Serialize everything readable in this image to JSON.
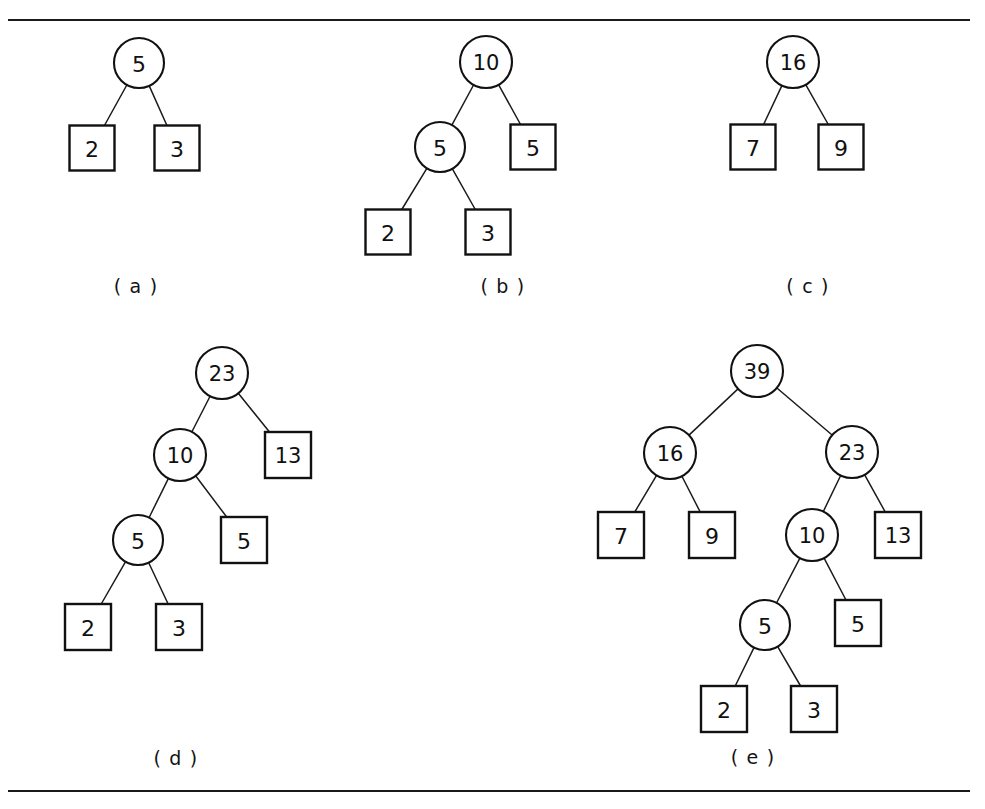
{
  "figure": {
    "background_color": "#ffffff",
    "ink_color": "#111111",
    "top_rule": {
      "x": 8,
      "y": 19,
      "width": 962,
      "label": "horizontal-rule-top"
    },
    "bottom_rule": {
      "x": 8,
      "y": 790,
      "width": 962,
      "label": "horizontal-rule-bottom"
    }
  },
  "panels": [
    {
      "id": "a",
      "label": "( a )",
      "label_x": 136,
      "label_y": 286,
      "nodes": [
        {
          "name": "node-circle-5",
          "shape": "circle",
          "value": "5",
          "cx": 139,
          "cy": 63,
          "r": 25
        },
        {
          "name": "node-square-2",
          "shape": "square",
          "value": "2",
          "cx": 92,
          "cy": 148,
          "size": 45
        },
        {
          "name": "node-square-3",
          "shape": "square",
          "value": "3",
          "cx": 177,
          "cy": 148,
          "size": 45
        }
      ],
      "edges": [
        {
          "from": "node-circle-5",
          "to": "node-square-2"
        },
        {
          "from": "node-circle-5",
          "to": "node-square-3"
        }
      ]
    },
    {
      "id": "b",
      "label": "( b )",
      "label_x": 503,
      "label_y": 286,
      "nodes": [
        {
          "name": "node-circle-10",
          "shape": "circle",
          "value": "10",
          "cx": 486,
          "cy": 62,
          "r": 26
        },
        {
          "name": "node-circle-5",
          "shape": "circle",
          "value": "5",
          "cx": 440,
          "cy": 147,
          "r": 25
        },
        {
          "name": "node-square-5",
          "shape": "square",
          "value": "5",
          "cx": 533,
          "cy": 147,
          "size": 45
        },
        {
          "name": "node-square-2",
          "shape": "square",
          "value": "2",
          "cx": 388,
          "cy": 232,
          "size": 45
        },
        {
          "name": "node-square-3",
          "shape": "square",
          "value": "3",
          "cx": 488,
          "cy": 232,
          "size": 45
        }
      ],
      "edges": [
        {
          "from": "node-circle-10",
          "to": "node-circle-5"
        },
        {
          "from": "node-circle-10",
          "to": "node-square-5"
        },
        {
          "from": "node-circle-5",
          "to": "node-square-2"
        },
        {
          "from": "node-circle-5",
          "to": "node-square-3"
        }
      ]
    },
    {
      "id": "c",
      "label": "( c )",
      "label_x": 808,
      "label_y": 286,
      "nodes": [
        {
          "name": "node-circle-16",
          "shape": "circle",
          "value": "16",
          "cx": 793,
          "cy": 62,
          "r": 26
        },
        {
          "name": "node-square-7",
          "shape": "square",
          "value": "7",
          "cx": 753,
          "cy": 147,
          "size": 45
        },
        {
          "name": "node-square-9",
          "shape": "square",
          "value": "9",
          "cx": 841,
          "cy": 147,
          "size": 45
        }
      ],
      "edges": [
        {
          "from": "node-circle-16",
          "to": "node-square-7"
        },
        {
          "from": "node-circle-16",
          "to": "node-square-9"
        }
      ]
    },
    {
      "id": "d",
      "label": "( d )",
      "label_x": 176,
      "label_y": 758,
      "nodes": [
        {
          "name": "node-circle-23",
          "shape": "circle",
          "value": "23",
          "cx": 222,
          "cy": 373,
          "r": 26
        },
        {
          "name": "node-circle-10",
          "shape": "circle",
          "value": "10",
          "cx": 180,
          "cy": 455,
          "r": 26
        },
        {
          "name": "node-square-13",
          "shape": "square",
          "value": "13",
          "cx": 288,
          "cy": 455,
          "size": 46
        },
        {
          "name": "node-circle-5",
          "shape": "circle",
          "value": "5",
          "cx": 138,
          "cy": 540,
          "r": 25
        },
        {
          "name": "node-square-5",
          "shape": "square",
          "value": "5",
          "cx": 244,
          "cy": 540,
          "size": 46
        },
        {
          "name": "node-square-2",
          "shape": "square",
          "value": "2",
          "cx": 88,
          "cy": 627,
          "size": 46
        },
        {
          "name": "node-square-3",
          "shape": "square",
          "value": "3",
          "cx": 179,
          "cy": 627,
          "size": 46
        }
      ],
      "edges": [
        {
          "from": "node-circle-23",
          "to": "node-circle-10"
        },
        {
          "from": "node-circle-23",
          "to": "node-square-13"
        },
        {
          "from": "node-circle-10",
          "to": "node-circle-5"
        },
        {
          "from": "node-circle-10",
          "to": "node-square-5"
        },
        {
          "from": "node-circle-5",
          "to": "node-square-2"
        },
        {
          "from": "node-circle-5",
          "to": "node-square-3"
        }
      ]
    },
    {
      "id": "e",
      "label": "( e )",
      "label_x": 753,
      "label_y": 757,
      "nodes": [
        {
          "name": "node-circle-39",
          "shape": "circle",
          "value": "39",
          "cx": 757,
          "cy": 371,
          "r": 26
        },
        {
          "name": "node-circle-16",
          "shape": "circle",
          "value": "16",
          "cx": 670,
          "cy": 453,
          "r": 26
        },
        {
          "name": "node-circle-23",
          "shape": "circle",
          "value": "23",
          "cx": 852,
          "cy": 452,
          "r": 26
        },
        {
          "name": "node-square-7",
          "shape": "square",
          "value": "7",
          "cx": 621,
          "cy": 535,
          "size": 46
        },
        {
          "name": "node-square-9",
          "shape": "square",
          "value": "9",
          "cx": 712,
          "cy": 535,
          "size": 46
        },
        {
          "name": "node-circle-10",
          "shape": "circle",
          "value": "10",
          "cx": 812,
          "cy": 535,
          "r": 26
        },
        {
          "name": "node-square-13",
          "shape": "square",
          "value": "13",
          "cx": 898,
          "cy": 535,
          "size": 46
        },
        {
          "name": "node-circle-5",
          "shape": "circle",
          "value": "5",
          "cx": 765,
          "cy": 625,
          "r": 25
        },
        {
          "name": "node-square-5",
          "shape": "square",
          "value": "5",
          "cx": 858,
          "cy": 623,
          "size": 46
        },
        {
          "name": "node-square-2",
          "shape": "square",
          "value": "2",
          "cx": 724,
          "cy": 709,
          "size": 46
        },
        {
          "name": "node-square-3",
          "shape": "square",
          "value": "3",
          "cx": 814,
          "cy": 709,
          "size": 46
        }
      ],
      "edges": [
        {
          "from": "node-circle-39",
          "to": "node-circle-16"
        },
        {
          "from": "node-circle-39",
          "to": "node-circle-23"
        },
        {
          "from": "node-circle-16",
          "to": "node-square-7"
        },
        {
          "from": "node-circle-16",
          "to": "node-square-9"
        },
        {
          "from": "node-circle-23",
          "to": "node-circle-10"
        },
        {
          "from": "node-circle-23",
          "to": "node-square-13"
        },
        {
          "from": "node-circle-10",
          "to": "node-circle-5"
        },
        {
          "from": "node-circle-10",
          "to": "node-square-5"
        },
        {
          "from": "node-circle-5",
          "to": "node-square-2"
        },
        {
          "from": "node-circle-5",
          "to": "node-square-3"
        }
      ]
    }
  ]
}
